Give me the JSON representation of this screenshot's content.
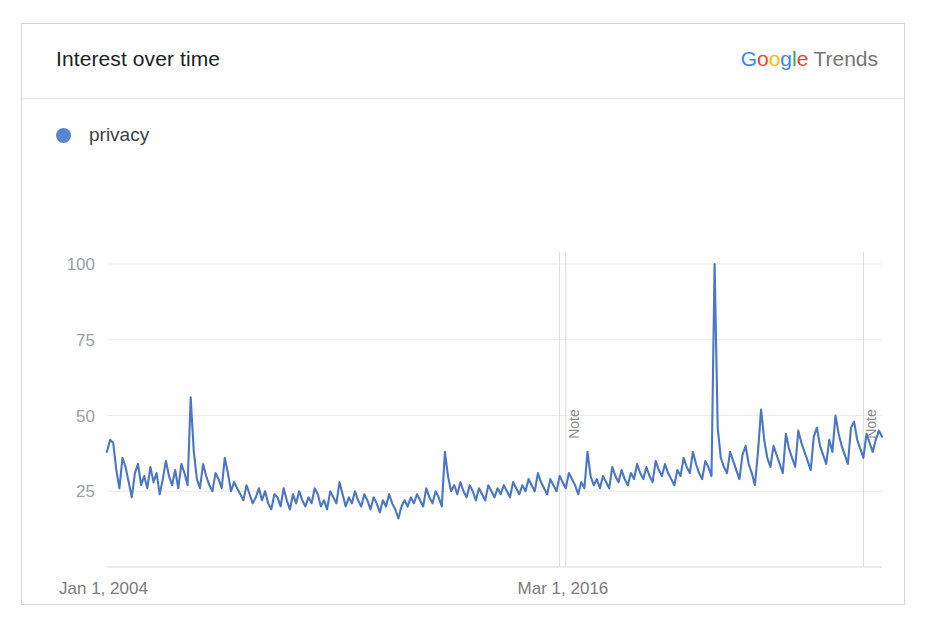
{
  "card": {
    "header": {
      "title": "Interest over time",
      "brand": {
        "g1": "G",
        "o1": "o",
        "o2": "o",
        "g2": "g",
        "l": "l",
        "e": "e",
        "product": "Trends"
      }
    },
    "legend": {
      "items": [
        {
          "label": "privacy",
          "color": "#5785d0"
        }
      ]
    },
    "annotations": [
      {
        "label": "Note",
        "x_value": 148
      },
      {
        "label": "Note",
        "x_value": 244
      }
    ]
  },
  "chart_data": {
    "type": "line",
    "title": "Interest over time",
    "xlabel": "",
    "ylabel": "",
    "ylim": [
      0,
      100
    ],
    "yticks": [
      25,
      50,
      75,
      100
    ],
    "ytick_labels": [
      "25",
      "50",
      "75",
      "100"
    ],
    "xticks": [
      0,
      146
    ],
    "xtick_labels": [
      "Jan 1, 2004",
      "Mar 1, 2016"
    ],
    "grid": true,
    "legend_position": "top-left",
    "accent_color": "#4a76c4",
    "series": [
      {
        "name": "privacy",
        "values": [
          38,
          42,
          41,
          32,
          26,
          36,
          33,
          28,
          23,
          31,
          34,
          27,
          30,
          26,
          33,
          28,
          31,
          24,
          29,
          35,
          30,
          27,
          32,
          26,
          34,
          31,
          27,
          56,
          38,
          29,
          26,
          34,
          30,
          27,
          25,
          31,
          29,
          26,
          36,
          31,
          25,
          28,
          26,
          24,
          22,
          27,
          24,
          21,
          23,
          26,
          22,
          25,
          21,
          19,
          24,
          23,
          20,
          26,
          22,
          19,
          24,
          21,
          25,
          22,
          20,
          23,
          21,
          26,
          24,
          20,
          22,
          19,
          25,
          23,
          21,
          28,
          24,
          20,
          23,
          21,
          25,
          22,
          20,
          24,
          22,
          19,
          23,
          21,
          18,
          22,
          20,
          24,
          21,
          19,
          16,
          20,
          22,
          20,
          23,
          21,
          24,
          22,
          20,
          26,
          23,
          21,
          25,
          23,
          20,
          38,
          30,
          25,
          27,
          24,
          28,
          25,
          23,
          27,
          25,
          22,
          26,
          24,
          22,
          27,
          25,
          23,
          26,
          24,
          27,
          25,
          23,
          28,
          26,
          24,
          27,
          25,
          29,
          27,
          25,
          31,
          28,
          26,
          24,
          29,
          27,
          25,
          30,
          28,
          26,
          31,
          29,
          27,
          24,
          28,
          26,
          38,
          30,
          27,
          29,
          26,
          30,
          28,
          26,
          33,
          30,
          28,
          32,
          29,
          27,
          31,
          29,
          34,
          31,
          29,
          33,
          30,
          28,
          35,
          32,
          30,
          34,
          31,
          29,
          27,
          32,
          30,
          36,
          33,
          31,
          38,
          34,
          31,
          29,
          35,
          33,
          30,
          100,
          46,
          36,
          33,
          31,
          38,
          35,
          32,
          29,
          37,
          40,
          34,
          31,
          27,
          38,
          52,
          42,
          36,
          33,
          40,
          37,
          34,
          31,
          44,
          39,
          36,
          33,
          45,
          41,
          38,
          35,
          32,
          43,
          46,
          40,
          37,
          34,
          42,
          38,
          50,
          44,
          40,
          37,
          34,
          46,
          48,
          42,
          39,
          36,
          44,
          41,
          38,
          42,
          45,
          43
        ]
      }
    ]
  }
}
